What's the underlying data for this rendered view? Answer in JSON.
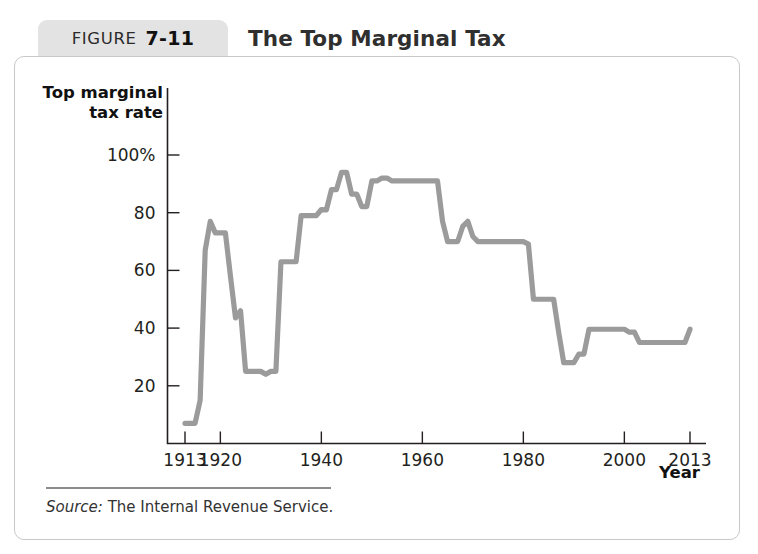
{
  "figure": {
    "label_word": "FIGURE",
    "number": "7-11",
    "title": "The Top Marginal Tax"
  },
  "source": {
    "prefix": "Source:",
    "text": "The Internal Revenue Service."
  },
  "colors": {
    "line": "#9b9b9b",
    "axis": "#231f20",
    "tab_background": "#e3e3e3",
    "card_border": "#c8c8c8",
    "source_rule": "#8c8c8c"
  },
  "chart_data": {
    "type": "line",
    "title": "The Top Marginal Tax",
    "xlabel": "Year",
    "ylabel": "Top marginal tax rate",
    "ylabel_lines": [
      "Top marginal",
      "tax rate"
    ],
    "xlim": [
      1913,
      2013
    ],
    "ylim": [
      0,
      105
    ],
    "grid": false,
    "legend": false,
    "xticks": [
      1913,
      1920,
      1940,
      1960,
      1980,
      2000,
      2013
    ],
    "xticklabels": [
      "1913",
      "1920",
      "1940",
      "1960",
      "1980",
      "2000",
      "2013"
    ],
    "yticks": [
      20,
      40,
      60,
      80,
      100
    ],
    "yticklabels": [
      "20",
      "40",
      "60",
      "80",
      "100%"
    ],
    "series": [
      {
        "name": "Top marginal tax rate",
        "x": [
          1913,
          1914,
          1915,
          1916,
          1917,
          1918,
          1919,
          1920,
          1921,
          1922,
          1923,
          1924,
          1925,
          1926,
          1927,
          1928,
          1929,
          1930,
          1931,
          1932,
          1933,
          1934,
          1935,
          1936,
          1937,
          1938,
          1939,
          1940,
          1941,
          1942,
          1943,
          1944,
          1945,
          1946,
          1947,
          1948,
          1949,
          1950,
          1951,
          1952,
          1953,
          1954,
          1955,
          1956,
          1957,
          1958,
          1959,
          1960,
          1961,
          1962,
          1963,
          1964,
          1965,
          1966,
          1967,
          1968,
          1969,
          1970,
          1971,
          1972,
          1973,
          1974,
          1975,
          1976,
          1977,
          1978,
          1979,
          1980,
          1981,
          1982,
          1983,
          1984,
          1985,
          1986,
          1987,
          1988,
          1989,
          1990,
          1991,
          1992,
          1993,
          1994,
          1995,
          1996,
          1997,
          1998,
          1999,
          2000,
          2001,
          2002,
          2003,
          2004,
          2005,
          2006,
          2007,
          2008,
          2009,
          2010,
          2011,
          2012,
          2013
        ],
        "y": [
          7,
          7,
          7,
          15,
          67,
          77,
          73,
          73,
          73,
          58,
          43.5,
          46,
          25,
          25,
          25,
          25,
          24,
          25,
          25,
          63,
          63,
          63,
          63,
          79,
          79,
          79,
          79,
          81.1,
          81,
          88,
          88,
          94,
          94,
          86.45,
          86.45,
          82.13,
          82.13,
          91,
          91,
          92,
          92,
          91,
          91,
          91,
          91,
          91,
          91,
          91,
          91,
          91,
          91,
          77,
          70,
          70,
          70,
          75.25,
          77,
          71.75,
          70,
          70,
          70,
          70,
          70,
          70,
          70,
          70,
          70,
          70,
          69.125,
          50,
          50,
          50,
          50,
          50,
          38.5,
          28,
          28,
          28,
          31,
          31,
          39.6,
          39.6,
          39.6,
          39.6,
          39.6,
          39.6,
          39.6,
          39.6,
          38.6,
          38.6,
          35,
          35,
          35,
          35,
          35,
          35,
          35,
          35,
          35,
          35,
          39.6
        ]
      }
    ]
  }
}
